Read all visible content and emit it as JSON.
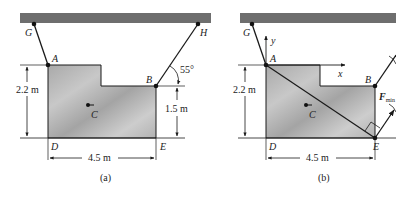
{
  "panel_a": {
    "caption": "(a)",
    "points": {
      "G": "G",
      "A": "A",
      "B": "B",
      "H": "H",
      "C": "C",
      "D": "D",
      "E": "E"
    },
    "angle_label": "55°",
    "dim_height_left": "2.2 m",
    "dim_height_right": "1.5 m",
    "dim_width": "4.5 m"
  },
  "panel_b": {
    "caption": "(b)",
    "points": {
      "G": "G",
      "A": "A",
      "B": "B",
      "C": "C",
      "D": "D",
      "E": "E"
    },
    "axis_x": "x",
    "axis_y": "y",
    "force_label": "F",
    "force_subscript": "min",
    "dim_height_left": "2.2 m",
    "dim_width": "4.5 m"
  },
  "colors": {
    "ceiling": "#6e6e6e",
    "plate": "#b9b9b9",
    "line": "#1a1a1a"
  }
}
